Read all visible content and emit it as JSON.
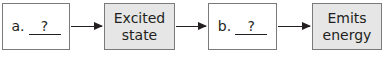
{
  "diagram": {
    "type": "flowchart",
    "nodes": [
      {
        "id": "a",
        "label": "a.",
        "blank": "?",
        "style": "white"
      },
      {
        "id": "excited",
        "label_line1": "Excited",
        "label_line2": "state",
        "style": "gray"
      },
      {
        "id": "b",
        "label": "b.",
        "blank": "?",
        "style": "white"
      },
      {
        "id": "emits",
        "label_line1": "Emits",
        "label_line2": "energy",
        "style": "gray"
      }
    ],
    "edges": [
      {
        "from": "a",
        "to": "excited"
      },
      {
        "from": "excited",
        "to": "b"
      },
      {
        "from": "b",
        "to": "emits"
      }
    ],
    "colors": {
      "gray_fill": "#e6e6e6",
      "border": "#7a7a7a",
      "text": "#231f20"
    }
  }
}
